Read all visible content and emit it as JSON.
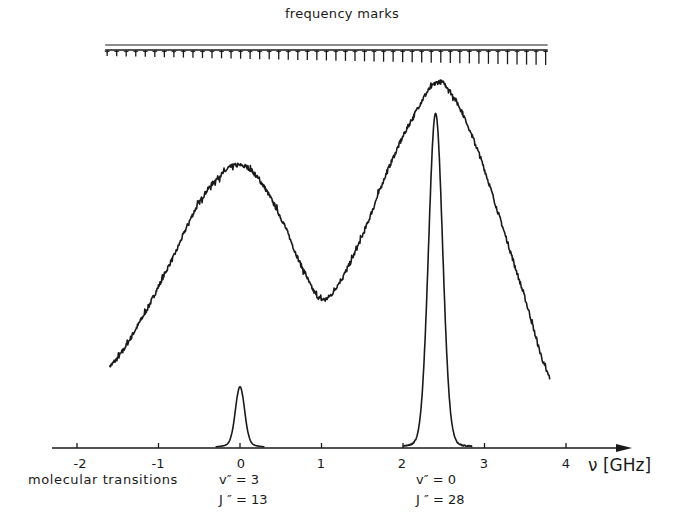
{
  "chart_data": {
    "type": "line",
    "title": "frequency marks",
    "xlabel": "ν [GHz]",
    "ylabel": "",
    "xlim": [
      -2.3,
      4.8
    ],
    "x_ticks": [
      -2,
      -1,
      0,
      1,
      2,
      3,
      4
    ],
    "x_tick_labels": [
      "-2",
      "-1",
      "0",
      "1",
      "2",
      "3",
      "4"
    ],
    "grid": false,
    "legend": null,
    "frequency_marks": {
      "label": "frequency marks",
      "count": 47,
      "x_start": -1.63,
      "x_end": 3.75
    },
    "series": [
      {
        "name": "broad fluorescence / absorption profile",
        "style": "noisy trace",
        "x": [
          -1.6,
          -1.2,
          -0.8,
          -0.5,
          -0.2,
          0.0,
          0.2,
          0.5,
          0.8,
          1.0,
          1.2,
          1.5,
          1.8,
          2.1,
          2.4,
          2.6,
          2.9,
          3.2,
          3.5,
          3.8
        ],
        "y": [
          0.22,
          0.35,
          0.52,
          0.66,
          0.74,
          0.76,
          0.73,
          0.62,
          0.47,
          0.4,
          0.44,
          0.57,
          0.74,
          0.88,
          0.98,
          0.95,
          0.81,
          0.61,
          0.4,
          0.19
        ]
      },
      {
        "name": "molecular transitions (reference peaks)",
        "style": "smooth trace",
        "x": [
          -0.3,
          -0.1,
          0.0,
          0.1,
          0.3,
          2.0,
          2.25,
          2.35,
          2.4,
          2.45,
          2.55,
          2.8
        ],
        "y": [
          0.0,
          0.05,
          0.18,
          0.05,
          0.0,
          0.0,
          0.12,
          0.6,
          0.94,
          0.6,
          0.12,
          0.0
        ]
      }
    ],
    "annotations": [
      {
        "text": "molecular transitions",
        "position": "below axis, left"
      },
      {
        "text": "v'' = 3",
        "x": 0.0
      },
      {
        "text": "J'' = 13",
        "x": 0.0
      },
      {
        "text": "v'' = 0",
        "x": 2.4
      },
      {
        "text": "J'' = 28",
        "x": 2.4
      }
    ]
  },
  "labels": {
    "title": "frequency marks",
    "axis_unit": "ν [GHz]",
    "ticks": [
      "-2",
      "-1",
      "0",
      "1",
      "2",
      "3",
      "4"
    ],
    "molecular_transitions": "molecular transitions",
    "t1_v": "v″ = 3",
    "t1_j": "J ″ = 13",
    "t2_v": "v″ = 0",
    "t2_j": "J ″ = 28"
  }
}
